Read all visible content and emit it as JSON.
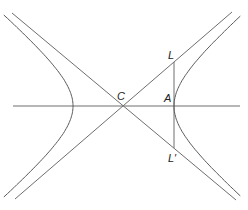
{
  "diagram": {
    "title": "",
    "type": "hyperbola with asymptotes and latus rectum",
    "labels": {
      "center": "C",
      "vertex": "A",
      "latus_top": "L",
      "latus_bottom": "L′"
    },
    "colors": {
      "background": "#ffffff",
      "stroke": "#6e6e6e",
      "text": "#222222"
    },
    "geometry": {
      "center": [
        122,
        106
      ],
      "right_vertex": [
        174,
        106
      ],
      "left_vertex": [
        73,
        106
      ],
      "latus_top_point": [
        174,
        62
      ],
      "latus_bottom_point": [
        174,
        148
      ],
      "axis_x_range": [
        13,
        240
      ]
    }
  }
}
